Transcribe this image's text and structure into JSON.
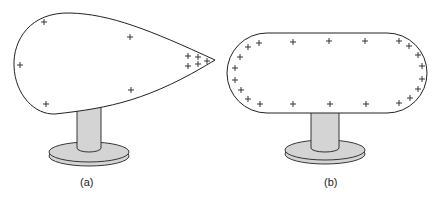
{
  "figure": {
    "panels": [
      {
        "id": "a",
        "label": "(a)",
        "shape": "teardrop conductor on insulating stand",
        "charge_symbol": "+"
      },
      {
        "id": "b",
        "label": "(b)",
        "shape": "capsule conductor on insulating stand",
        "charge_symbol": "+"
      }
    ],
    "colors": {
      "outline": "#222222",
      "stand_fill": "#d4d4d4",
      "background": "#ffffff"
    }
  }
}
